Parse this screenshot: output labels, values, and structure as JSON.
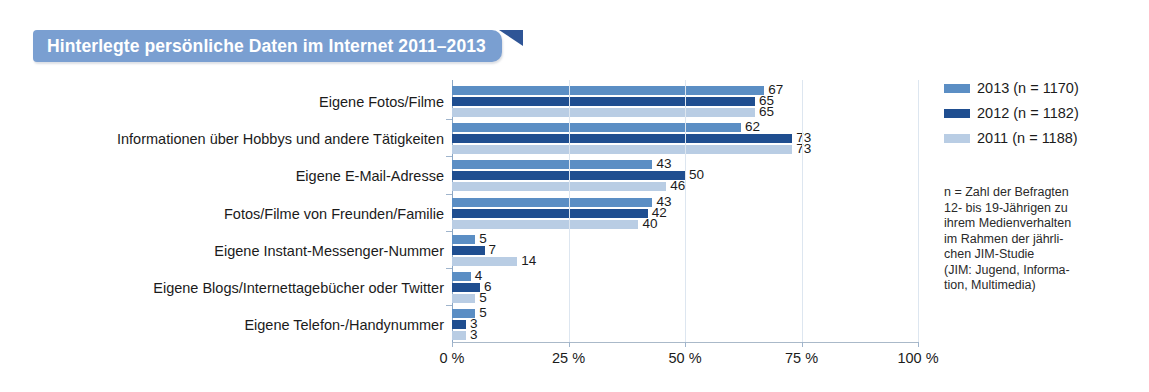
{
  "title": "Hinterlegte persönliche Daten im Internet 2011–2013",
  "colors": {
    "banner": "#7a9fd1",
    "banner_flag": "#2f5596",
    "y2013": "#5b8ec4",
    "y2012": "#1f4e90",
    "y2011": "#b9cde4",
    "axis": "#8aa7c6",
    "grid": "#dde6f0"
  },
  "legend": {
    "items": [
      {
        "label": "2013 (n = 1170)",
        "series": "2013",
        "color": "#5b8ec4"
      },
      {
        "label": "2012 (n = 1182)",
        "series": "2012",
        "color": "#1f4e90"
      },
      {
        "label": "2011 (n = 1188)",
        "series": "2011",
        "color": "#b9cde4"
      }
    ]
  },
  "note_lines": [
    "n = Zahl der Befragten",
    "12- bis 19-Jährigen zu",
    "ihrem Medienverhalten",
    "im Rahmen der jährli-",
    "chen JIM-Studie",
    "(JIM: Jugend, Informa-",
    "tion, Multimedia)"
  ],
  "chart_data": {
    "type": "bar",
    "orientation": "horizontal",
    "title": "Hinterlegte persönliche Daten im Internet 2011–2013",
    "xlabel": "",
    "ylabel": "",
    "xlim": [
      0,
      100
    ],
    "xticks": [
      0,
      25,
      50,
      75,
      100
    ],
    "xticklabels": [
      "0 %",
      "25 %",
      "50 %",
      "75 %",
      "100 %"
    ],
    "grid": true,
    "legend_position": "right",
    "categories": [
      "Eigene Fotos/Filme",
      "Informationen über Hobbys und andere Tätigkeiten",
      "Eigene E-Mail-Adresse",
      "Fotos/Filme von Freunden/Familie",
      "Eigene Instant-Messenger-Nummer",
      "Eigene Blogs/Internettagebücher oder Twitter",
      "Eigene Telefon-/Handynummer"
    ],
    "series": [
      {
        "name": "2013 (n = 1170)",
        "color": "#5b8ec4",
        "values": [
          67,
          62,
          43,
          43,
          5,
          4,
          5
        ]
      },
      {
        "name": "2012 (n = 1182)",
        "color": "#1f4e90",
        "values": [
          65,
          73,
          50,
          42,
          7,
          6,
          3
        ]
      },
      {
        "name": "2011 (n = 1188)",
        "color": "#b9cde4",
        "values": [
          65,
          73,
          46,
          40,
          14,
          5,
          3
        ]
      }
    ]
  }
}
